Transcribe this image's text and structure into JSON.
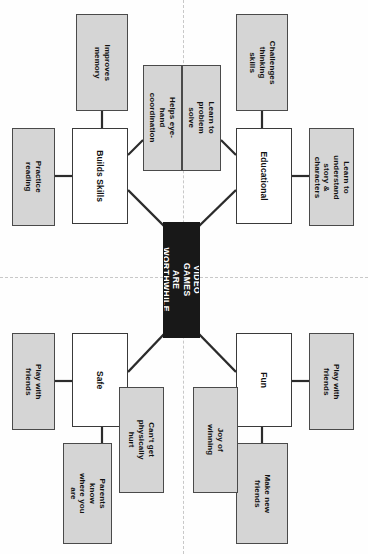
{
  "diagram": {
    "type": "mind-map",
    "orientation": "rotated-90-clockwise",
    "central": {
      "label": "VIDEO GAMES\nARE WORTHWHILE",
      "fill": "#181818",
      "text_color": "#ffffff"
    },
    "colors": {
      "branch_fill": "#ffffff",
      "leaf_fill": "#d5d5d5",
      "stroke": "#3a3a3a",
      "guide": "#c8c8c8",
      "page": "#fefefe"
    },
    "branches": [
      {
        "id": "builds-skills",
        "label": "Builds Skills",
        "leaves": [
          {
            "id": "improves-memory",
            "label": "Improves memory"
          },
          {
            "id": "practice-reading",
            "label": "Practice reading"
          },
          {
            "id": "helps-eye-hand-coordination",
            "label": "Helps eye-hand\ncoordination"
          }
        ]
      },
      {
        "id": "educational",
        "label": "Educational",
        "leaves": [
          {
            "id": "challenges-thinking-skills",
            "label": "Challenges thinking\nskills"
          },
          {
            "id": "learn-to-problem-solve",
            "label": "Learn to problem\nsolve"
          },
          {
            "id": "learn-to-understand-story-characters",
            "label": "Learn to understand\nstory & characters"
          }
        ]
      },
      {
        "id": "safe",
        "label": "Safe",
        "leaves": [
          {
            "id": "play-with-friends-safe",
            "label": "Play with friends"
          },
          {
            "id": "parents-know-where-you-are",
            "label": "Parents know\nwhere you are"
          },
          {
            "id": "cant-get-physically-hurt",
            "label": "Can't get\nphysically hurt"
          }
        ]
      },
      {
        "id": "fun",
        "label": "Fun",
        "leaves": [
          {
            "id": "play-with-friends-fun",
            "label": "Play with friends"
          },
          {
            "id": "make-new-friends",
            "label": "Make new friends"
          },
          {
            "id": "joy-of-winning",
            "label": "Joy of winning"
          }
        ]
      }
    ]
  }
}
